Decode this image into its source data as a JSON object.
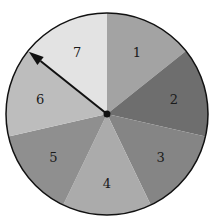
{
  "spinner": {
    "center": [
      107,
      114
    ],
    "radius": 101,
    "sections": [
      {
        "label": "1",
        "color": "#a3a3a3"
      },
      {
        "label": "2",
        "color": "#6e6e6e"
      },
      {
        "label": "3",
        "color": "#858585"
      },
      {
        "label": "4",
        "color": "#ababab"
      },
      {
        "label": "5",
        "color": "#8f8f8f"
      },
      {
        "label": "6",
        "color": "#bdbdbd"
      },
      {
        "label": "7",
        "color": "#e3e3e3"
      }
    ],
    "arrow_points_to": "7/6 boundary"
  }
}
